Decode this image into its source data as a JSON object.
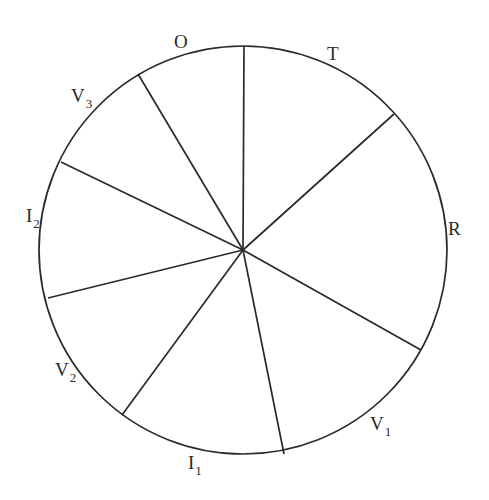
{
  "diagram": {
    "type": "circle divided into sectors by radial spokes",
    "circle": {
      "cx": 243,
      "cy": 250,
      "r": 204
    },
    "stroke_color": "#2a2a2a",
    "background_color": "#ffffff",
    "spokes": [
      {
        "x": 244,
        "y": 46
      },
      {
        "x": 394,
        "y": 114
      },
      {
        "x": 421,
        "y": 350
      },
      {
        "x": 284,
        "y": 454
      },
      {
        "x": 122,
        "y": 415
      },
      {
        "x": 48,
        "y": 298
      },
      {
        "x": 61,
        "y": 162
      },
      {
        "x": 138,
        "y": 74
      }
    ],
    "labels": [
      {
        "id": "O",
        "main": "O",
        "sub": "",
        "x": 174,
        "y": 48
      },
      {
        "id": "T",
        "main": "T",
        "sub": "",
        "x": 327,
        "y": 60
      },
      {
        "id": "R",
        "main": "R",
        "sub": "",
        "x": 448,
        "y": 235
      },
      {
        "id": "V1",
        "main": "V",
        "sub": "1",
        "x": 370,
        "y": 430
      },
      {
        "id": "I1",
        "main": "I",
        "sub": "1",
        "x": 188,
        "y": 469
      },
      {
        "id": "V2",
        "main": "V",
        "sub": "2",
        "x": 55,
        "y": 376
      },
      {
        "id": "I2",
        "main": "I",
        "sub": "2",
        "x": 26,
        "y": 222
      },
      {
        "id": "V3",
        "main": "V",
        "sub": "3",
        "x": 71,
        "y": 102
      }
    ]
  }
}
